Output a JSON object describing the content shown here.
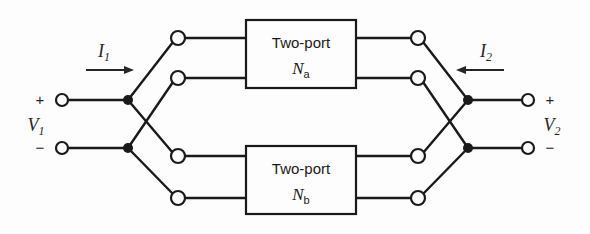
{
  "figure": {
    "type": "circuit-diagram",
    "background_color": "#fdfdfd",
    "line_color": "#1a1a1a",
    "width": 590,
    "height": 234
  },
  "blocks": [
    {
      "id": "network-a",
      "title": "Two-port",
      "name": "N",
      "subscript": "a",
      "x": 246,
      "y": 20,
      "width": 110,
      "height": 68
    },
    {
      "id": "network-b",
      "title": "Two-port",
      "name": "N",
      "subscript": "b",
      "x": 246,
      "y": 146,
      "width": 110,
      "height": 68
    }
  ],
  "ports": {
    "left": {
      "current_label": "I",
      "current_subscript": "1",
      "current_direction": "right",
      "voltage_label": "V",
      "voltage_subscript": "1",
      "plus_sign": "+",
      "minus_sign": "−"
    },
    "right": {
      "current_label": "I",
      "current_subscript": "2",
      "current_direction": "left",
      "voltage_label": "V",
      "voltage_subscript": "2",
      "plus_sign": "+",
      "minus_sign": "−"
    }
  },
  "terminals": {
    "left_outer": [
      {
        "id": "left-plus",
        "cx": 62,
        "cy": 100,
        "r": 6
      },
      {
        "id": "left-minus",
        "cx": 62,
        "cy": 148,
        "r": 6
      }
    ],
    "right_outer": [
      {
        "id": "right-plus",
        "cx": 528,
        "cy": 100,
        "r": 6
      },
      {
        "id": "right-minus",
        "cx": 528,
        "cy": 148,
        "r": 6
      }
    ],
    "left_inner": [
      {
        "id": "na-in-top",
        "cx": 178,
        "cy": 38,
        "r": 7
      },
      {
        "id": "na-in-bot",
        "cx": 178,
        "cy": 78,
        "r": 7
      },
      {
        "id": "nb-in-top",
        "cx": 178,
        "cy": 156,
        "r": 7
      },
      {
        "id": "nb-in-bot",
        "cx": 178,
        "cy": 198,
        "r": 7
      }
    ],
    "right_inner": [
      {
        "id": "na-out-top",
        "cx": 418,
        "cy": 38,
        "r": 7
      },
      {
        "id": "na-out-bot",
        "cx": 418,
        "cy": 78,
        "r": 7
      },
      {
        "id": "nb-out-top",
        "cx": 418,
        "cy": 156,
        "r": 7
      },
      {
        "id": "nb-out-bot",
        "cx": 418,
        "cy": 198,
        "r": 7
      }
    ]
  },
  "junctions": [
    {
      "id": "left-top-node",
      "cx": 128,
      "cy": 100,
      "r": 5
    },
    {
      "id": "left-bot-node",
      "cx": 128,
      "cy": 148,
      "r": 5
    },
    {
      "id": "right-top-node",
      "cx": 468,
      "cy": 100,
      "r": 5
    },
    {
      "id": "right-bot-node",
      "cx": 468,
      "cy": 148,
      "r": 5
    }
  ],
  "arrows": {
    "left": {
      "x1": 86,
      "x2": 134,
      "y": 70
    },
    "right": {
      "x1": 504,
      "x2": 456,
      "y": 70
    }
  }
}
